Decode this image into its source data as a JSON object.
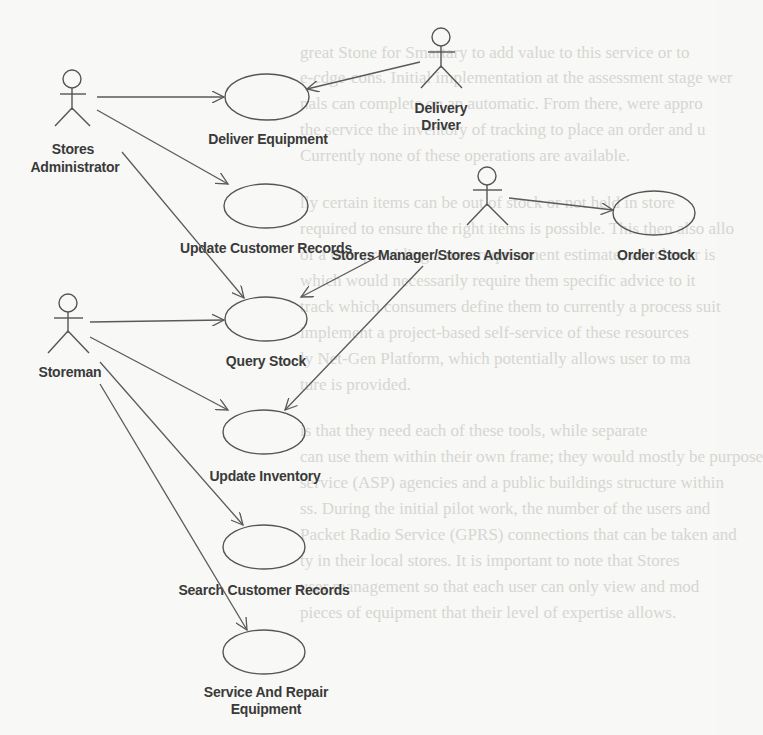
{
  "diagram": {
    "type": "UML use case diagram",
    "actors": [
      {
        "id": "stores-administrator",
        "label_lines": [
          "Stores",
          "Administrator"
        ]
      },
      {
        "id": "delivery-driver",
        "label_lines": [
          "Delivery",
          "Driver"
        ]
      },
      {
        "id": "stores-manager",
        "label_lines": [
          "Stores Manager/Stores Advisor"
        ]
      },
      {
        "id": "storeman",
        "label_lines": [
          "Storeman"
        ]
      }
    ],
    "use_cases": [
      {
        "id": "deliver-equipment",
        "label_lines": [
          "Deliver Equipment"
        ]
      },
      {
        "id": "update-customer-records",
        "label_lines": [
          "Update Customer Records"
        ]
      },
      {
        "id": "query-stock",
        "label_lines": [
          "Query Stock"
        ]
      },
      {
        "id": "update-inventory",
        "label_lines": [
          "Update Inventory"
        ]
      },
      {
        "id": "search-customer-records",
        "label_lines": [
          "Search Customer Records"
        ]
      },
      {
        "id": "service-and-repair-equipment",
        "label_lines": [
          "Service And Repair",
          "Equipment"
        ]
      },
      {
        "id": "order-stock",
        "label_lines": [
          "Order Stock"
        ]
      }
    ],
    "associations": [
      {
        "from": "stores-administrator",
        "to": "deliver-equipment"
      },
      {
        "from": "stores-administrator",
        "to": "update-customer-records"
      },
      {
        "from": "stores-administrator",
        "to": "query-stock"
      },
      {
        "from": "delivery-driver",
        "to": "deliver-equipment"
      },
      {
        "from": "stores-manager",
        "to": "order-stock"
      },
      {
        "from": "stores-manager",
        "to": "query-stock"
      },
      {
        "from": "stores-manager",
        "to": "update-inventory"
      },
      {
        "from": "storeman",
        "to": "query-stock"
      },
      {
        "from": "storeman",
        "to": "update-inventory"
      },
      {
        "from": "storeman",
        "to": "search-customer-records"
      },
      {
        "from": "storeman",
        "to": "service-and-repair-equipment"
      }
    ]
  },
  "background_bleed_text": [
    "great Stone for Smartary to add value to this service or to",
    "e-cdge-cons. Initial implementation at the assessment stage wer",
    "nals can complete on an automatic. From there, were appro",
    "the service the inventory of tracking to place an order and u",
    "Currently none of these operations are available.",
    "lly certain items can be out of stock or not held in store",
    "required to ensure the right items is possible. This then also allo",
    "of a user providing a new requirement estimate, whichever is",
    "which would necessarily require them specific advice to it",
    "track which consumers define them to currently a process suit",
    "implement a project-based self-service of these resources",
    "ly Net-Gen Platform, which potentially allows user to ma",
    "ture is provided.",
    "is that they need each of these tools, while separate",
    "can use them within their own frame; they would mostly be purpose",
    "service (ASP) agencies and a public buildings structure within",
    "ss. During the initial pilot work, the number of the users and",
    "Packet Radio Service (GPRS) connections that can be taken and",
    "ty in their local stores. It is important to note that Stores",
    "user management so that each user can only view and mod",
    "pieces of equipment that their level of expertise allows."
  ]
}
